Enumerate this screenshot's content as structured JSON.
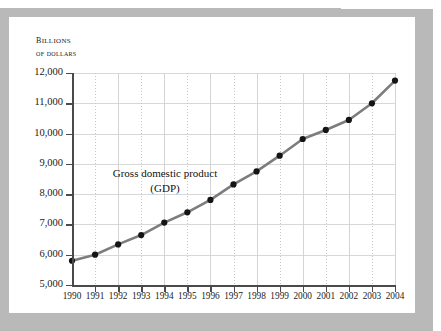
{
  "axis_caption": {
    "line1": "Billions",
    "line2": "of dollars"
  },
  "annotation": {
    "line1": "Gross domestic product",
    "line2": "(GDP)"
  },
  "colors": {
    "frame": "#b9b9b9",
    "card": "#ffffff",
    "line": "#7d7d7d",
    "marker": "#141414",
    "axis": "#4a4a4a",
    "grid": "#d8d8d8"
  },
  "chart_data": {
    "type": "line",
    "title": "",
    "subtitle": "",
    "xlabel": "",
    "ylabel": "Billions of dollars",
    "series_name": "Gross domestic product (GDP)",
    "categories": [
      "1990",
      "1991",
      "1992",
      "1993",
      "1994",
      "1995",
      "1996",
      "1997",
      "1998",
      "1999",
      "2000",
      "2001",
      "2002",
      "2003",
      "2004"
    ],
    "values": [
      5800,
      6000,
      6340,
      6650,
      7060,
      7400,
      7810,
      8320,
      8750,
      9270,
      9820,
      10120,
      10450,
      11000,
      11750
    ],
    "ylim": [
      5000,
      12000
    ],
    "yticks": [
      5000,
      6000,
      7000,
      8000,
      9000,
      10000,
      11000,
      12000
    ],
    "ytick_labels": [
      "5,000",
      "6,000",
      "7,000",
      "8,000",
      "9,000",
      "10,000",
      "11,000",
      "12,000"
    ],
    "grid": true,
    "legend": "none",
    "annotations": [
      "Gross domestic product (GDP)"
    ]
  }
}
